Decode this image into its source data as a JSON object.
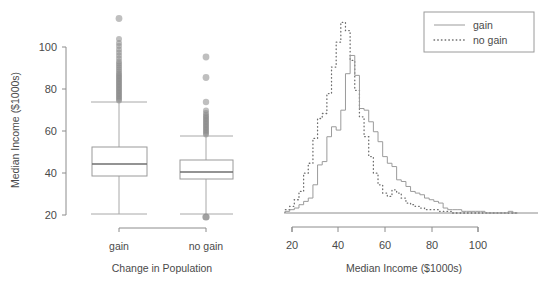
{
  "figure": {
    "background": "#ffffff",
    "ink_color": "#4a4a4a",
    "line_color": "#9b9b9b",
    "point_color": "#8a8a8a"
  },
  "left_panel": {
    "y_axis_title": "Median Income ($1000s)",
    "x_axis_title": "Change in Population",
    "y_ticks": [
      "20",
      "40",
      "60",
      "80",
      "100"
    ],
    "categories": [
      "gain",
      "no gain"
    ]
  },
  "right_panel": {
    "x_axis_title": "Median Income ($1000s)",
    "x_ticks": [
      "20",
      "40",
      "60",
      "80",
      "100"
    ],
    "legend": {
      "items": [
        {
          "label": "gain",
          "style": "solid"
        },
        {
          "label": "no gain",
          "style": "dotted"
        }
      ]
    }
  },
  "chart_data": [
    {
      "type": "box",
      "title": "",
      "xlabel": "Change in Population",
      "ylabel": "Median Income ($1000s)",
      "ylim": [
        18,
        117
      ],
      "yticks": [
        20,
        40,
        60,
        80,
        100
      ],
      "grid": false,
      "categories": [
        "gain",
        "no gain"
      ],
      "series": [
        {
          "name": "gain",
          "min_whisker": 20.8,
          "q1": 38.2,
          "median": 44.2,
          "q3": 52.2,
          "max_whisker": 73.8,
          "outliers_high": [
            74.5,
            75.2,
            76.0,
            76.8,
            77.5,
            78.3,
            79.0,
            79.8,
            80.5,
            81.3,
            82.0,
            82.8,
            83.5,
            84.3,
            85.0,
            85.8,
            86.5,
            87.3,
            88.0,
            89.0,
            90.0,
            91.0,
            92.0,
            93.0,
            94.0,
            95.5,
            97.0,
            98.5,
            100.0,
            101.5,
            103.0,
            105.0,
            114.2
          ],
          "outliers_low": []
        },
        {
          "name": "no gain",
          "min_whisker": 21.0,
          "q1": 34.8,
          "median": 39.5,
          "q3": 43.9,
          "max_whisker": 57.4,
          "outliers_high": [
            58.0,
            58.6,
            59.2,
            59.8,
            60.4,
            61.0,
            61.6,
            62.2,
            62.8,
            63.4,
            64.0,
            64.6,
            65.2,
            66.0,
            67.0,
            68.0,
            72.2,
            83.8,
            103.2
          ],
          "outliers_low": [
            19.8
          ]
        }
      ]
    },
    {
      "type": "line",
      "title": "",
      "xlabel": "Median Income ($1000s)",
      "ylabel": "",
      "xlim": [
        17,
        118
      ],
      "ylim": [
        0,
        120
      ],
      "xticks": [
        20,
        40,
        60,
        80,
        100
      ],
      "grid": false,
      "legend_position": "top-right",
      "note": "Overlaid frequency polygons (step histograms) of median income for the two groups.",
      "x": [
        18,
        20,
        22,
        24,
        26,
        28,
        30,
        32,
        34,
        36,
        38,
        40,
        42,
        44,
        46,
        48,
        50,
        52,
        54,
        56,
        58,
        60,
        62,
        64,
        66,
        68,
        70,
        72,
        74,
        76,
        78,
        80,
        82,
        84,
        86,
        88,
        90,
        92,
        94,
        96,
        98,
        100,
        102,
        104,
        106,
        108,
        110,
        112,
        114,
        116
      ],
      "series": [
        {
          "name": "gain",
          "style": "solid",
          "values": [
            1,
            2,
            3,
            5,
            7,
            9,
            17,
            29,
            31,
            46,
            52,
            50,
            62,
            84,
            95,
            83,
            63,
            62,
            55,
            49,
            43,
            34,
            30,
            28,
            20,
            19,
            16,
            13,
            12,
            11,
            9,
            8,
            7,
            6,
            3,
            2,
            2,
            2,
            1,
            1,
            1,
            1,
            1,
            0,
            0,
            0,
            0,
            0,
            1,
            0
          ]
        },
        {
          "name": "no gain",
          "style": "dotted",
          "values": [
            2,
            4,
            8,
            13,
            24,
            30,
            45,
            57,
            60,
            72,
            88,
            103,
            115,
            110,
            92,
            74,
            58,
            46,
            34,
            24,
            17,
            12,
            10,
            14,
            12,
            9,
            6,
            5,
            4,
            3,
            2,
            2,
            2,
            1,
            1,
            1,
            0,
            0,
            0,
            0,
            0,
            0,
            0,
            0,
            0,
            0,
            0,
            0,
            0,
            0
          ]
        }
      ]
    }
  ]
}
